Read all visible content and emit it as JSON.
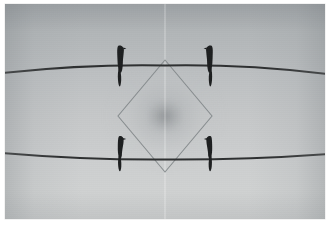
{
  "image": {
    "title": "Four birds perched on two power lines",
    "medium": "black-and-white photograph, mirrored composition",
    "border_color": "#ffffff",
    "frame": {
      "x": 5,
      "y": 4,
      "width": 320,
      "height": 215
    },
    "caption_mark": ""
  },
  "sky": {
    "description": "overcast pale grey sky, lighter toward the lower centre",
    "top_color": "#a9adb0",
    "mid_color": "#c2c5c6",
    "bottom_color": "#cfd1d1",
    "vignette_color": "#787e82"
  },
  "center_glow": {
    "label": "soft radial glow at mirror axis",
    "cx_pct": 50,
    "cy_pct": 52,
    "color": "#7e8285"
  },
  "wires": [
    {
      "name": "upper-wire",
      "color": "#3a3c3d",
      "stroke_width": 1.9,
      "left_y": 69,
      "center_y": 62,
      "right_y": 70
    },
    {
      "name": "lower-wire",
      "color": "#3a3c3d",
      "stroke_width": 1.9,
      "left_y": 149,
      "center_y": 155,
      "right_y": 150
    }
  ],
  "diamond": {
    "name": "diamond-overlay",
    "stroke_color": "#7d8285",
    "stroke_width": 1.0,
    "vertices": {
      "top": {
        "x": 160,
        "y": 56
      },
      "right": {
        "x": 207,
        "y": 112
      },
      "bottom": {
        "x": 160,
        "y": 168
      },
      "left": {
        "x": 113,
        "y": 112
      }
    }
  },
  "birds": [
    {
      "name": "bird-top-left",
      "perch_x": 115,
      "perch_y": 64,
      "color": "#1e2021",
      "facing": "right",
      "tail": "long-down"
    },
    {
      "name": "bird-top-right",
      "perch_x": 205,
      "perch_y": 64,
      "color": "#1e2021",
      "facing": "left",
      "tail": "long-down"
    },
    {
      "name": "bird-bottom-left",
      "perch_x": 115,
      "perch_y": 152,
      "color": "#1e2021",
      "facing": "right",
      "tail": "short-down"
    },
    {
      "name": "bird-bottom-right",
      "perch_x": 205,
      "perch_y": 152,
      "color": "#1e2021",
      "facing": "left",
      "tail": "short-down"
    }
  ],
  "counts": {
    "birds": 4,
    "wires": 2,
    "shapes": 1
  }
}
